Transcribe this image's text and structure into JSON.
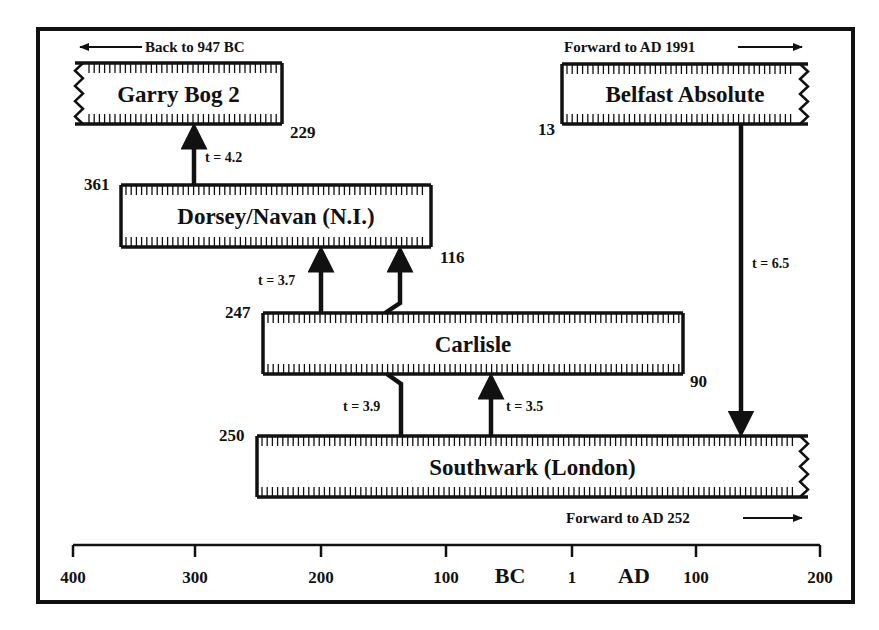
{
  "colors": {
    "ink": "#111111",
    "background": "#ffffff"
  },
  "axis": {
    "y": 545,
    "x_start": 73,
    "x_end": 820,
    "ticks": [
      {
        "x": 73,
        "label": "400"
      },
      {
        "x": 195,
        "label": "300"
      },
      {
        "x": 321,
        "label": "200"
      },
      {
        "x": 446,
        "label": "100"
      },
      {
        "x": 572,
        "label": "1"
      },
      {
        "x": 696,
        "label": "100"
      },
      {
        "x": 820,
        "label": "200"
      }
    ],
    "era_labels": [
      {
        "x": 510,
        "label": "BC"
      },
      {
        "x": 634,
        "label": "AD"
      }
    ]
  },
  "chronologies": [
    {
      "id": "garry-bog-2",
      "name": "Garry Bog 2",
      "x1": 75,
      "x2": 282,
      "y1": 63,
      "y2": 124,
      "zigzag_left": true,
      "zigzag_right": false,
      "end_label": "229",
      "end_label_x": 290,
      "end_label_y": 138,
      "extension_text": "Back to 947 BC",
      "extension_dir": "left",
      "extension_x": 145,
      "extension_y": 52,
      "extension_arrow_x1": 142,
      "extension_arrow_x2": 80
    },
    {
      "id": "belfast-absolute",
      "name": "Belfast Absolute",
      "x1": 562,
      "x2": 808,
      "y1": 64,
      "y2": 124,
      "zigzag_left": false,
      "zigzag_right": true,
      "start_label": "13",
      "start_label_x": 538,
      "start_label_y": 135,
      "extension_text": "Forward to AD 1991",
      "extension_dir": "right",
      "extension_x": 564,
      "extension_y": 52,
      "extension_arrow_x1": 738,
      "extension_arrow_x2": 802
    },
    {
      "id": "dorsey-navan",
      "name": "Dorsey/Navan (N.I.)",
      "x1": 121,
      "x2": 431,
      "y1": 185,
      "y2": 247,
      "zigzag_left": false,
      "zigzag_right": false,
      "start_label": "361",
      "start_label_x": 84,
      "start_label_y": 190,
      "end_label": "116",
      "end_label_x": 440,
      "end_label_y": 263
    },
    {
      "id": "carlisle",
      "name": "Carlisle",
      "x1": 263,
      "x2": 683,
      "y1": 313,
      "y2": 374,
      "zigzag_left": false,
      "zigzag_right": false,
      "start_label": "247",
      "start_label_x": 225,
      "start_label_y": 318,
      "end_label": "90",
      "end_label_x": 690,
      "end_label_y": 387
    },
    {
      "id": "southwark-london",
      "name": "Southwark (London)",
      "x1": 257,
      "x2": 808,
      "y1": 436,
      "y2": 497,
      "zigzag_left": false,
      "zigzag_right": true,
      "start_label": "250",
      "start_label_x": 219,
      "start_label_y": 441,
      "extension_text": "Forward to AD 252",
      "extension_dir": "right",
      "extension_x": 566,
      "extension_y": 523,
      "extension_arrow_x1": 743,
      "extension_arrow_x2": 802
    }
  ],
  "links": [
    {
      "id": "link-dorsey-garry",
      "t_label": "t = 4.2",
      "label_x": 205,
      "label_y": 162,
      "points": [
        [
          194,
          185
        ],
        [
          194,
          124
        ]
      ],
      "arrow": "end"
    },
    {
      "id": "link-carlisle-dorsey-a",
      "t_label": "t = 3.7",
      "label_x": 258,
      "label_y": 285,
      "points": [
        [
          321,
          313
        ],
        [
          321,
          247
        ]
      ],
      "arrow": "end"
    },
    {
      "id": "link-carlisle-dorsey-b",
      "t_label": "",
      "label_x": 0,
      "label_y": 0,
      "points": [
        [
          385,
          313
        ],
        [
          400,
          303
        ],
        [
          400,
          247
        ]
      ],
      "arrow": "end"
    },
    {
      "id": "link-southwark-carlisle-a",
      "t_label": "t = 3.9",
      "label_x": 343,
      "label_y": 411,
      "points": [
        [
          387,
          374
        ],
        [
          401,
          384
        ],
        [
          401,
          436
        ]
      ],
      "arrow": "none"
    },
    {
      "id": "link-southwark-carlisle-b",
      "t_label": "t = 3.5",
      "label_x": 506,
      "label_y": 411,
      "points": [
        [
          491,
          436
        ],
        [
          491,
          374
        ]
      ],
      "arrow": "end"
    },
    {
      "id": "link-belfast-southwark",
      "t_label": "t = 6.5",
      "label_x": 752,
      "label_y": 268,
      "points": [
        [
          741,
          124
        ],
        [
          741,
          436
        ]
      ],
      "arrow": "end"
    }
  ],
  "chart_data": {
    "type": "table",
    "xlabel": "BC | AD",
    "axis_ticks": [
      "400 BC",
      "300 BC",
      "200 BC",
      "100 BC",
      "1",
      "100 AD",
      "200 AD"
    ],
    "xlim": [
      -400,
      200
    ],
    "chronologies": [
      {
        "name": "Garry Bog 2",
        "start": "947 BC (extends back)",
        "end": "229 BC"
      },
      {
        "name": "Belfast Absolute",
        "start": "13 BC",
        "end": "AD 1991 (extends forward)"
      },
      {
        "name": "Dorsey/Navan (N.I.)",
        "start": "361 BC",
        "end": "116 BC"
      },
      {
        "name": "Carlisle",
        "start": "247 BC",
        "end": "AD 90"
      },
      {
        "name": "Southwark (London)",
        "start": "250 BC",
        "end": "AD 252 (extends forward)"
      }
    ],
    "links": [
      {
        "from": "Dorsey/Navan (N.I.)",
        "to": "Garry Bog 2",
        "t": 4.2
      },
      {
        "from": "Carlisle",
        "to": "Dorsey/Navan (N.I.)",
        "t": 3.7
      },
      {
        "from": "Carlisle",
        "to": "Southwark (London)",
        "t": 3.9
      },
      {
        "from": "Southwark (London)",
        "to": "Carlisle",
        "t": 3.5
      },
      {
        "from": "Belfast Absolute",
        "to": "Southwark (London)",
        "t": 6.5
      }
    ]
  }
}
